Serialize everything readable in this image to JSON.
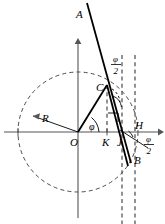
{
  "figure": {
    "type": "geometry-diagram",
    "canvas": {
      "width": 165,
      "height": 224,
      "background": "#ffffff"
    },
    "colors": {
      "stroke_main": "#000000",
      "stroke_axis": "#555555",
      "stroke_dashed": "#4a4a4a",
      "background": "#ffffff"
    },
    "origin": {
      "x": 78,
      "y": 132
    },
    "circle": {
      "cx": 78,
      "cy": 132,
      "r": 60,
      "style": "dashed"
    },
    "points": [
      {
        "name": "A",
        "label": "A",
        "x": 87,
        "y": 3,
        "label_x": 76,
        "label_y": 17
      },
      {
        "name": "C",
        "label": "C",
        "x": 107,
        "y": 85,
        "label_x": 97,
        "label_y": 90
      },
      {
        "name": "O",
        "label": "O",
        "x": 78,
        "y": 132,
        "label_x": 71,
        "label_y": 144
      },
      {
        "name": "R",
        "label": "R",
        "x": 29,
        "y": 117,
        "label_x": 45,
        "label_y": 121
      },
      {
        "name": "K",
        "label": "K",
        "x": 107,
        "y": 132,
        "label_x": 103,
        "label_y": 144
      },
      {
        "name": "J",
        "label": "J",
        "x": 122,
        "y": 132,
        "label_x": 118,
        "label_y": 144
      },
      {
        "name": "H",
        "label": "H",
        "x": 135,
        "y": 132,
        "label_x": 133,
        "label_y": 128
      },
      {
        "name": "B",
        "label": "B",
        "x": 130,
        "y": 160,
        "label_x": 134,
        "label_y": 161
      }
    ],
    "angle_labels": [
      {
        "name": "phi-at-origin",
        "text": "φ",
        "x": 92,
        "y": 128,
        "kind": "plain"
      },
      {
        "name": "phi-over-2-upper",
        "numerator": "φ",
        "denominator": "2",
        "x": 116,
        "y": 63
      },
      {
        "name": "phi-over-2-lower",
        "numerator": "φ",
        "denominator": "2",
        "x": 146,
        "y": 143
      }
    ],
    "segments": [
      {
        "name": "segment-OC",
        "from": "O",
        "to": "C",
        "weight": "bold"
      },
      {
        "name": "segment-AB",
        "from": "A",
        "to": "B",
        "weight": "bold"
      },
      {
        "name": "segment-OR",
        "from": "O",
        "to": "R",
        "weight": "thin"
      },
      {
        "name": "segment-CJ-chord",
        "from": "C",
        "to": "J",
        "weight": "bold"
      }
    ],
    "dashed_verticals": [
      {
        "name": "dashed-vline-K",
        "x": 107,
        "y1": 85,
        "y2": 132
      },
      {
        "name": "dashed-vline-J",
        "x": 122,
        "y1": 55,
        "y2": 224
      },
      {
        "name": "dashed-vline-H",
        "x": 135,
        "y1": 55,
        "y2": 224
      }
    ],
    "axes": {
      "x_axis": {
        "name": "x-axis",
        "x1": 4,
        "y1": 132,
        "x2": 161,
        "y2": 132,
        "arrow": "right"
      },
      "y_axis": {
        "name": "y-axis",
        "x1": 78,
        "y1": 218,
        "x2": 78,
        "y2": 40,
        "arrow": "up"
      }
    },
    "ticks": [
      {
        "name": "tick-left",
        "x": 18,
        "y": 132
      },
      {
        "name": "tick-K",
        "x": 107,
        "y": 132
      }
    ]
  }
}
